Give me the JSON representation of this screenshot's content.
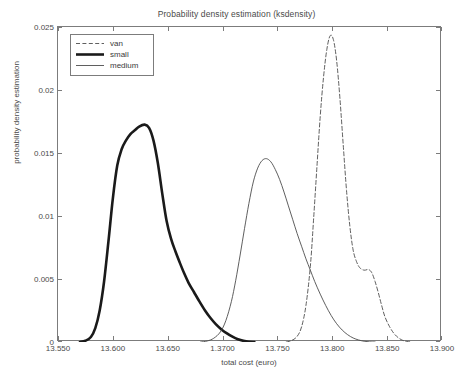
{
  "chart_data": {
    "type": "line",
    "title": "Probability density estimation (ksdensity)",
    "xlabel": "total cost (euro)",
    "ylabel": "probability density estimation",
    "xlim": [
      13.55,
      13.9
    ],
    "ylim": [
      0,
      0.025
    ],
    "grid": false,
    "legend_position": "upper-left",
    "xticks": [
      "13.550",
      "13.600",
      "13.650",
      "1.3700",
      "13.750",
      "13.800",
      "13.850",
      "13.900"
    ],
    "xtick_values": [
      13.55,
      13.6,
      13.65,
      13.7,
      13.75,
      13.8,
      13.85,
      13.9
    ],
    "yticks": [
      "0",
      "0.005",
      "0.01",
      "0.015",
      "0.02",
      "0.025"
    ],
    "ytick_values": [
      0,
      0.005,
      0.01,
      0.015,
      0.02,
      0.025
    ],
    "series": [
      {
        "name": "van",
        "style": "dashed",
        "width": "thin",
        "color": "#4d4d4d",
        "peak_x": 13.798,
        "peak_y": 0.0243,
        "points": [
          [
            13.758,
            0.0
          ],
          [
            13.763,
            0.00012
          ],
          [
            13.768,
            0.00045
          ],
          [
            13.772,
            0.0012
          ],
          [
            13.776,
            0.0029
          ],
          [
            13.78,
            0.006
          ],
          [
            13.783,
            0.0098
          ],
          [
            13.786,
            0.0139
          ],
          [
            13.789,
            0.0179
          ],
          [
            13.792,
            0.021
          ],
          [
            13.795,
            0.0232
          ],
          [
            13.798,
            0.0243
          ],
          [
            13.801,
            0.024
          ],
          [
            13.804,
            0.0223
          ],
          [
            13.807,
            0.0193
          ],
          [
            13.81,
            0.0156
          ],
          [
            13.813,
            0.012
          ],
          [
            13.816,
            0.0092
          ],
          [
            13.819,
            0.0073
          ],
          [
            13.822,
            0.0064
          ],
          [
            13.825,
            0.0059
          ],
          [
            13.829,
            0.0057
          ],
          [
            13.833,
            0.00575
          ],
          [
            13.836,
            0.0055
          ],
          [
            13.839,
            0.0048
          ],
          [
            13.842,
            0.0039
          ],
          [
            13.845,
            0.0029
          ],
          [
            13.848,
            0.002
          ],
          [
            13.852,
            0.00125
          ],
          [
            13.856,
            0.0007
          ],
          [
            13.86,
            0.00035
          ],
          [
            13.864,
            0.00014
          ],
          [
            13.868,
            4e-05
          ],
          [
            13.872,
            0.0
          ]
        ]
      },
      {
        "name": "small",
        "style": "solid",
        "width": "thick",
        "color": "#1a1a1a",
        "peak_x": 13.629,
        "peak_y": 0.01725,
        "points": [
          [
            13.57,
            0.0
          ],
          [
            13.575,
            0.0001
          ],
          [
            13.58,
            0.0004
          ],
          [
            13.584,
            0.0011
          ],
          [
            13.588,
            0.0025
          ],
          [
            13.592,
            0.0048
          ],
          [
            13.596,
            0.008
          ],
          [
            13.6,
            0.0114
          ],
          [
            13.604,
            0.014
          ],
          [
            13.608,
            0.0153
          ],
          [
            13.612,
            0.016
          ],
          [
            13.616,
            0.0165
          ],
          [
            13.62,
            0.0168
          ],
          [
            13.624,
            0.0171
          ],
          [
            13.629,
            0.01725
          ],
          [
            13.633,
            0.017
          ],
          [
            13.637,
            0.016
          ],
          [
            13.641,
            0.0142
          ],
          [
            13.645,
            0.0118
          ],
          [
            13.649,
            0.0096
          ],
          [
            13.653,
            0.0082
          ],
          [
            13.657,
            0.0072
          ],
          [
            13.661,
            0.0063
          ],
          [
            13.665,
            0.00545
          ],
          [
            13.669,
            0.0047
          ],
          [
            13.674,
            0.00395
          ],
          [
            13.679,
            0.0032
          ],
          [
            13.684,
            0.0025
          ],
          [
            13.689,
            0.0019
          ],
          [
            13.694,
            0.0014
          ],
          [
            13.699,
            0.001
          ],
          [
            13.704,
            0.00068
          ],
          [
            13.709,
            0.00042
          ],
          [
            13.714,
            0.00022
          ],
          [
            13.719,
            9e-05
          ],
          [
            13.724,
            2e-05
          ],
          [
            13.729,
            0.0
          ]
        ]
      },
      {
        "name": "medium",
        "style": "solid",
        "width": "thin",
        "color": "#4d4d4d",
        "peak_x": 13.74,
        "peak_y": 0.01455,
        "points": [
          [
            13.68,
            0.0
          ],
          [
            13.686,
            8e-05
          ],
          [
            13.692,
            0.0003
          ],
          [
            13.698,
            0.0008
          ],
          [
            13.703,
            0.0017
          ],
          [
            13.708,
            0.0032
          ],
          [
            13.712,
            0.0049
          ],
          [
            13.716,
            0.0069
          ],
          [
            13.72,
            0.009
          ],
          [
            13.724,
            0.011
          ],
          [
            13.728,
            0.0127
          ],
          [
            13.732,
            0.0138
          ],
          [
            13.736,
            0.0144
          ],
          [
            13.74,
            0.01455
          ],
          [
            13.744,
            0.0143
          ],
          [
            13.748,
            0.0137
          ],
          [
            13.752,
            0.0129
          ],
          [
            13.756,
            0.0119
          ],
          [
            13.76,
            0.0108
          ],
          [
            13.764,
            0.0097
          ],
          [
            13.768,
            0.0086
          ],
          [
            13.772,
            0.0076
          ],
          [
            13.776,
            0.0066
          ],
          [
            13.78,
            0.0057
          ],
          [
            13.784,
            0.0048
          ],
          [
            13.789,
            0.0038
          ],
          [
            13.794,
            0.0029
          ],
          [
            13.799,
            0.0021
          ],
          [
            13.804,
            0.00145
          ],
          [
            13.809,
            0.00095
          ],
          [
            13.814,
            0.00058
          ],
          [
            13.819,
            0.00032
          ],
          [
            13.824,
            0.00016
          ],
          [
            13.829,
            6e-05
          ],
          [
            13.834,
            1e-05
          ],
          [
            13.839,
            0.0
          ]
        ]
      }
    ]
  },
  "legend": {
    "items": [
      {
        "label": "van"
      },
      {
        "label": "small"
      },
      {
        "label": "medium"
      }
    ]
  }
}
